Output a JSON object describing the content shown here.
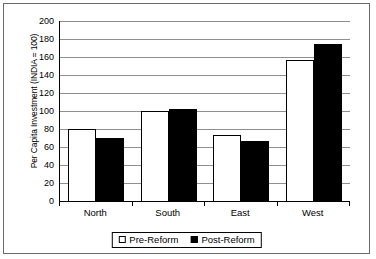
{
  "chart_data": {
    "type": "bar",
    "title": "",
    "subtitle": "",
    "xlabel": "",
    "ylabel": "Per Capita Investment (INDIA = 100)",
    "categories": [
      "North",
      "South",
      "East",
      "West"
    ],
    "series": [
      {
        "name": "Pre-Reform",
        "values": [
          80,
          100,
          73,
          157
        ],
        "color": "#ffffff"
      },
      {
        "name": "Post-Reform",
        "values": [
          70,
          102,
          67,
          174
        ],
        "color": "#000000"
      }
    ],
    "ylim": [
      0,
      200
    ],
    "ytick_step": 20,
    "yticks": [
      200,
      180,
      160,
      140,
      120,
      100,
      80,
      60,
      40,
      20,
      0
    ],
    "grid": true,
    "grid_axis": "y",
    "legend_position": "bottom-center",
    "legend_border": true,
    "plot_border_color": "#000000",
    "grid_color": "#8f8f8f",
    "frame_border_color": "#6b6b6b"
  }
}
